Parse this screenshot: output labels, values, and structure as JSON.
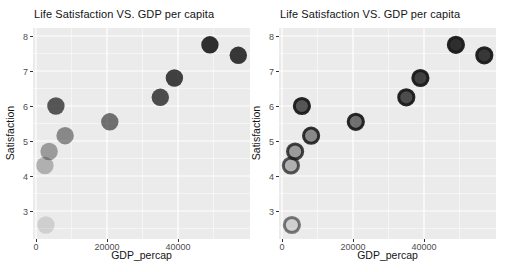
{
  "figure": {
    "background": "#ffffff",
    "panel_bg": "#ebebeb",
    "grid_color": "#ffffff",
    "tick_label_color": "#4d4d4d",
    "point_base_color": "#1a1a1a"
  },
  "chart_data": [
    {
      "type": "scatter",
      "title": "Life Satisfaction VS. GDP per capita",
      "xlabel": "GDP_percap",
      "ylabel": "Satisfaction",
      "xlim": [
        0,
        59700
      ],
      "ylim": [
        2.77,
        8.23
      ],
      "x_ticks": [
        0,
        20000,
        40000
      ],
      "y_ticks": [
        3,
        4,
        5,
        6,
        7,
        8
      ],
      "grid": true,
      "legend": "none",
      "point_style": "solid fill, opacity mapped to Satisfaction",
      "points": [
        {
          "GDP_percap": 2800,
          "Satisfaction": 2.6,
          "alpha": 0.13
        },
        {
          "GDP_percap": 2500,
          "Satisfaction": 4.3,
          "alpha": 0.28
        },
        {
          "GDP_percap": 3700,
          "Satisfaction": 4.7,
          "alpha": 0.38
        },
        {
          "GDP_percap": 8200,
          "Satisfaction": 5.15,
          "alpha": 0.47
        },
        {
          "GDP_percap": 20800,
          "Satisfaction": 5.55,
          "alpha": 0.6
        },
        {
          "GDP_percap": 5600,
          "Satisfaction": 6.0,
          "alpha": 0.72
        },
        {
          "GDP_percap": 35000,
          "Satisfaction": 6.25,
          "alpha": 0.76
        },
        {
          "GDP_percap": 39000,
          "Satisfaction": 6.8,
          "alpha": 0.82
        },
        {
          "GDP_percap": 57000,
          "Satisfaction": 7.45,
          "alpha": 0.86
        },
        {
          "GDP_percap": 49000,
          "Satisfaction": 7.75,
          "alpha": 0.9
        }
      ]
    },
    {
      "type": "scatter",
      "title": "Life Satisfaction VS. GDP per capita",
      "xlabel": "GDP_percap",
      "ylabel": "Satisfaction",
      "xlim": [
        0,
        59700
      ],
      "ylim": [
        2.77,
        8.23
      ],
      "x_ticks": [
        0,
        20000,
        40000
      ],
      "y_ticks": [
        3,
        4,
        5,
        6,
        7,
        8
      ],
      "grid": true,
      "legend": "none",
      "point_style": "dark outlined ring, fill opacity mapped to Satisfaction",
      "points": [
        {
          "GDP_percap": 2800,
          "Satisfaction": 2.6,
          "alpha": 0.13,
          "stroke_alpha": 0.55
        },
        {
          "GDP_percap": 2500,
          "Satisfaction": 4.3,
          "alpha": 0.28,
          "stroke_alpha": 0.7
        },
        {
          "GDP_percap": 3700,
          "Satisfaction": 4.7,
          "alpha": 0.38,
          "stroke_alpha": 0.8
        },
        {
          "GDP_percap": 8200,
          "Satisfaction": 5.15,
          "alpha": 0.47,
          "stroke_alpha": 0.88
        },
        {
          "GDP_percap": 20800,
          "Satisfaction": 5.55,
          "alpha": 0.6,
          "stroke_alpha": 0.93
        },
        {
          "GDP_percap": 5600,
          "Satisfaction": 6.0,
          "alpha": 0.72,
          "stroke_alpha": 0.95
        },
        {
          "GDP_percap": 35000,
          "Satisfaction": 6.25,
          "alpha": 0.76,
          "stroke_alpha": 0.95
        },
        {
          "GDP_percap": 39000,
          "Satisfaction": 6.8,
          "alpha": 0.82,
          "stroke_alpha": 0.95
        },
        {
          "GDP_percap": 57000,
          "Satisfaction": 7.45,
          "alpha": 0.86,
          "stroke_alpha": 0.95
        },
        {
          "GDP_percap": 49000,
          "Satisfaction": 7.75,
          "alpha": 0.9,
          "stroke_alpha": 0.95
        }
      ]
    }
  ]
}
